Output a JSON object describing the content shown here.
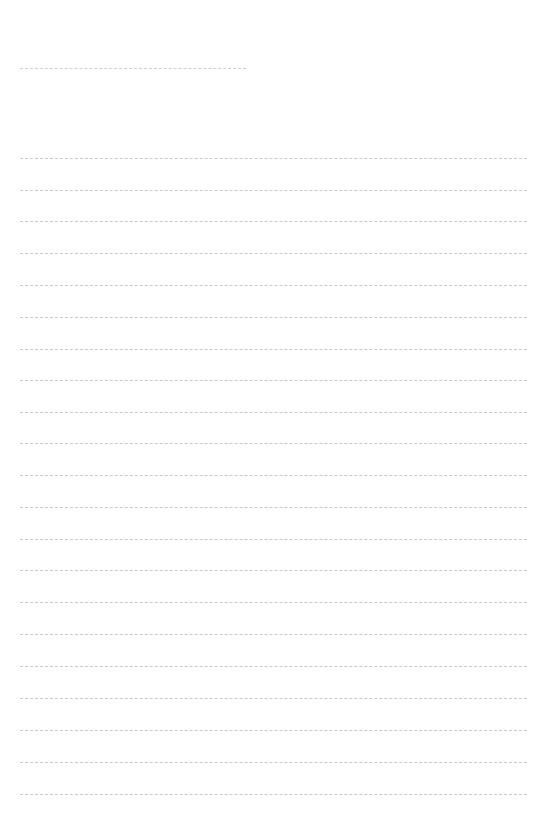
{
  "page": {
    "type": "blank ruled sheet",
    "background": "#ffffff",
    "line_color": "#c9c9c9",
    "title_line": {
      "text": "",
      "top": 68,
      "left": 20,
      "width": 226
    },
    "rules": {
      "count": 21,
      "left": 20,
      "width": 507,
      "positions": [
        158,
        190,
        221,
        253,
        285,
        317,
        349,
        380,
        412,
        443,
        475,
        507,
        539,
        570,
        602,
        634,
        666,
        698,
        730,
        762,
        794
      ],
      "lines_text": [
        "",
        "",
        "",
        "",
        "",
        "",
        "",
        "",
        "",
        "",
        "",
        "",
        "",
        "",
        "",
        "",
        "",
        "",
        "",
        "",
        ""
      ]
    }
  }
}
